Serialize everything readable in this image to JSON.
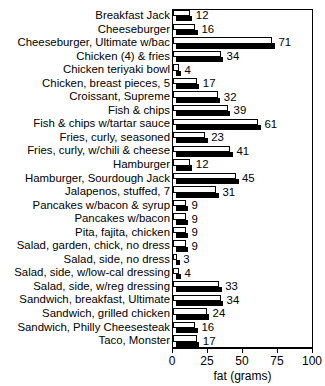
{
  "chart_data": {
    "type": "bar",
    "orientation": "horizontal",
    "title": "",
    "title_fragment_visible": "",
    "xlabel": "fat (grams)",
    "ylabel": "",
    "xlim": [
      0,
      100
    ],
    "xticks": [
      0,
      25,
      50,
      75,
      100
    ],
    "xtick_labels": [
      "0",
      "25",
      "50",
      "75",
      "100"
    ],
    "grid": false,
    "legend": null,
    "value_labels_shown": true,
    "categories": [
      "Breakfast Jack",
      "Cheeseburger",
      "Cheeseburger, Ultimate w/bac",
      "Chicken (4) & fries",
      "Chicken teriyaki bowl",
      "Chicken, breast pieces, 5",
      "Croissant, Supreme",
      "Fish & chips",
      "Fish & chips w/tartar sauce",
      "Fries, curly, seasoned",
      "Fries, curly, w/chili & cheese",
      "Hamburger",
      "Hamburger, Sourdough Jack",
      "Jalapenos, stuffed, 7",
      "Pancakes w/bacon & syrup",
      "Pancakes w/bacon",
      "Pita, fajita, chicken",
      "Salad, garden, chick, no dress",
      "Salad, side, no dress",
      "Salad, side, w/low-cal dressing",
      "Salad, side, w/reg dressing",
      "Sandwich, breakfast, Ultimate",
      "Sandwich, grilled chicken",
      "Sandwich, Philly Cheesesteak",
      "Taco, Monster"
    ],
    "values": [
      12,
      16,
      71,
      34,
      4,
      17,
      32,
      39,
      61,
      23,
      41,
      12,
      45,
      31,
      9,
      9,
      9,
      9,
      3,
      4,
      33,
      34,
      24,
      16,
      17
    ]
  }
}
